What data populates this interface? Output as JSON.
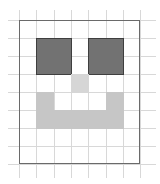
{
  "diagram": {
    "title": "",
    "grid": {
      "cols": 7,
      "rows": 8,
      "origin_x": 19,
      "origin_y": 20,
      "cell_w": 17.3,
      "cell_h": 18
    },
    "colors": {
      "eye": "#727272",
      "eye_border": "#3f3f3f",
      "nose": "#d6d6d6",
      "smile": "#c6c6c6",
      "grid": "#d8d8d8",
      "frame": "#6a6a6a"
    },
    "shapes": [
      {
        "name": "left-eye",
        "col": 1,
        "row": 1,
        "w": 2,
        "h": 2,
        "kind": "eye"
      },
      {
        "name": "right-eye",
        "col": 4,
        "row": 1,
        "w": 2,
        "h": 2,
        "kind": "eye"
      },
      {
        "name": "nose",
        "col": 3,
        "row": 3,
        "w": 1,
        "h": 1,
        "kind": "nose"
      },
      {
        "name": "smile-left",
        "col": 1,
        "row": 4,
        "w": 1,
        "h": 1,
        "kind": "smile"
      },
      {
        "name": "smile-right",
        "col": 5,
        "row": 4,
        "w": 1,
        "h": 1,
        "kind": "smile"
      },
      {
        "name": "smile-bottom",
        "col": 1,
        "row": 5,
        "w": 5,
        "h": 1,
        "kind": "smile"
      }
    ]
  }
}
